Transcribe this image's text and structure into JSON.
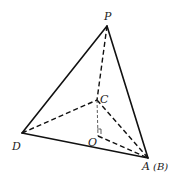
{
  "figure": {
    "type": "geometry-pyramid",
    "vertices": {
      "P": "P",
      "C": "C",
      "D": "D",
      "O": "O",
      "A": "A",
      "B_paren": "(B)"
    },
    "edges": {
      "solid": [
        "PD",
        "PA",
        "DA"
      ],
      "dashed": [
        "PC",
        "DC",
        "CA",
        "OA"
      ],
      "dashed_thin": [
        "CO"
      ]
    },
    "right_angle_at": "O"
  }
}
